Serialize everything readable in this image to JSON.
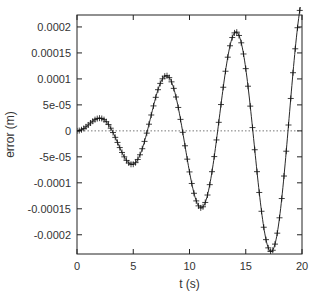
{
  "chart_data": {
    "type": "line",
    "title": "",
    "xlabel": "t (s)",
    "ylabel": "error (m)",
    "xlim": [
      0,
      20
    ],
    "ylim": [
      -0.000237,
      0.000223
    ],
    "grid": false,
    "legend": null,
    "x_ticks": [
      0,
      5,
      10,
      15,
      20
    ],
    "x_tick_labels": [
      "0",
      "5",
      "10",
      "15",
      "20"
    ],
    "y_ticks": [
      0.0002,
      0.00015,
      0.0001,
      5e-05,
      0,
      -5e-05,
      -0.0001,
      -0.00015,
      -0.0002
    ],
    "y_tick_labels": [
      "0.0002",
      "0.00015",
      "0.0001",
      "5e-05",
      "0",
      "-5e-05",
      "-0.0001",
      "-0.00015",
      "-0.0002"
    ],
    "zero_line": {
      "style": "dotted",
      "y": 0
    },
    "series": [
      {
        "name": "error",
        "style": "solid line with + markers",
        "color": "#000000",
        "extrema": [
          {
            "t": 2.2,
            "value": 2.6e-05
          },
          {
            "t": 5.1,
            "value": -6.6e-05
          },
          {
            "t": 8.1,
            "value": 0.000106
          },
          {
            "t": 11.2,
            "value": -0.00015
          },
          {
            "t": 14.4,
            "value": 0.00019
          },
          {
            "t": 17.5,
            "value": -0.000235
          },
          {
            "t": 20.0,
            "value": 0.000225
          }
        ],
        "zero_crossings": [
          0,
          3.4,
          6.6,
          9.7,
          12.8,
          15.9,
          19.0
        ],
        "model": "e(t) ≈ 1.35e-5 · t · sin(1.005 · t)"
      }
    ]
  },
  "colors": {
    "axis": "#222222",
    "curve": "#111111",
    "zero_line": "#555555"
  }
}
